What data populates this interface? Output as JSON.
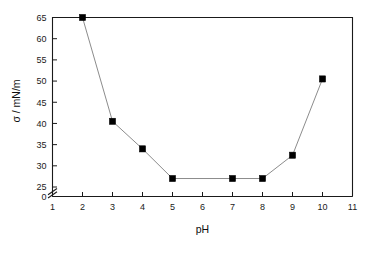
{
  "chart_data": {
    "type": "line",
    "title": "",
    "subtitle": "",
    "xlabel": "pH",
    "ylabel": "σ / mN/m",
    "xlim": [
      1,
      11
    ],
    "ylim": [
      25,
      65
    ],
    "y_axis_break": true,
    "y_break_from": 0,
    "y_break_to": 25,
    "xticks": [
      1,
      2,
      3,
      4,
      5,
      6,
      7,
      8,
      9,
      10,
      11
    ],
    "xtick_labels": [
      "1",
      "2",
      "3",
      "4",
      "5",
      "6",
      "7",
      "8",
      "9",
      "10",
      "11"
    ],
    "yticks": [
      0,
      25,
      30,
      35,
      40,
      45,
      50,
      55,
      60,
      65
    ],
    "ytick_labels": [
      "0",
      "25",
      "30",
      "35",
      "40",
      "45",
      "50",
      "55",
      "60",
      "65"
    ],
    "grid": false,
    "legend": null,
    "marker": "filled-square",
    "marker_color": "#000000",
    "line_color": "#8c8c8c",
    "x": [
      2,
      3,
      4,
      5,
      7,
      8,
      9,
      10
    ],
    "values": [
      65.0,
      40.5,
      34.0,
      27.0,
      27.0,
      27.0,
      32.5,
      50.5
    ],
    "series": [
      {
        "name": "surface tension",
        "x": [
          2,
          3,
          4,
          5,
          7,
          8,
          9,
          10
        ],
        "values": [
          65.0,
          40.5,
          34.0,
          27.0,
          27.0,
          27.0,
          32.5,
          50.5
        ]
      }
    ]
  },
  "axes": {
    "x_title": "pH",
    "y_title": "σ / mN/m"
  }
}
